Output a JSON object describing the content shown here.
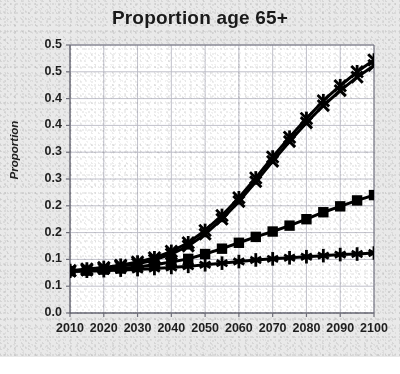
{
  "chart_data": {
    "type": "line",
    "title": "Proportion age 65+",
    "xlabel": "",
    "ylabel": "Proportion",
    "grid": true,
    "legend": "none",
    "xlim": [
      2010,
      2100
    ],
    "ylim": [
      0.0,
      0.5
    ],
    "x_tick_labels": [
      "2010",
      "2020",
      "2030",
      "2040",
      "2050",
      "2060",
      "2070",
      "2080",
      "2090",
      "2100"
    ],
    "x_tick_values": [
      2010,
      2020,
      2030,
      2040,
      2050,
      2060,
      2070,
      2080,
      2090,
      2100
    ],
    "y_tick_labels": [
      "0.5",
      "0.5",
      "0.4",
      "0.4",
      "0.3",
      "0.3",
      "0.2",
      "0.2",
      "0.1",
      "0.1",
      "0.0"
    ],
    "y_tick_values": [
      0.5,
      0.45,
      0.4,
      0.35,
      0.3,
      0.25,
      0.2,
      0.15,
      0.1,
      0.05,
      0.0
    ],
    "x": [
      2010,
      2015,
      2020,
      2025,
      2030,
      2035,
      2040,
      2045,
      2050,
      2055,
      2060,
      2065,
      2070,
      2075,
      2080,
      2085,
      2090,
      2095,
      2100
    ],
    "series": [
      {
        "name": "series-upper-x",
        "marker": "x-cross",
        "color": "#000000",
        "values": [
          0.078,
          0.08,
          0.083,
          0.087,
          0.092,
          0.099,
          0.11,
          0.125,
          0.147,
          0.175,
          0.208,
          0.245,
          0.283,
          0.32,
          0.355,
          0.387,
          0.415,
          0.44,
          0.462
        ]
      },
      {
        "name": "series-upper-star",
        "marker": "star",
        "color": "#000000",
        "values": [
          0.079,
          0.082,
          0.085,
          0.089,
          0.095,
          0.103,
          0.115,
          0.131,
          0.154,
          0.182,
          0.215,
          0.252,
          0.291,
          0.328,
          0.363,
          0.396,
          0.424,
          0.45,
          0.472
        ]
      },
      {
        "name": "series-middle-square",
        "marker": "square",
        "color": "#000000",
        "values": [
          0.078,
          0.079,
          0.081,
          0.083,
          0.086,
          0.09,
          0.095,
          0.101,
          0.11,
          0.12,
          0.131,
          0.142,
          0.152,
          0.163,
          0.175,
          0.188,
          0.199,
          0.21,
          0.22
        ]
      },
      {
        "name": "series-lower-plus",
        "marker": "plus-star",
        "color": "#000000",
        "values": [
          0.078,
          0.078,
          0.079,
          0.08,
          0.081,
          0.083,
          0.085,
          0.087,
          0.09,
          0.093,
          0.096,
          0.099,
          0.101,
          0.103,
          0.105,
          0.107,
          0.109,
          0.11,
          0.112
        ]
      }
    ]
  },
  "style": {
    "plot_background": "#ffffff",
    "figure_background": "#e9e9e9",
    "grid_color": "#b9b9c4",
    "axis_color": "#6f6f7a",
    "ink_color": "#000000",
    "text_color": "#1f1f1f"
  }
}
